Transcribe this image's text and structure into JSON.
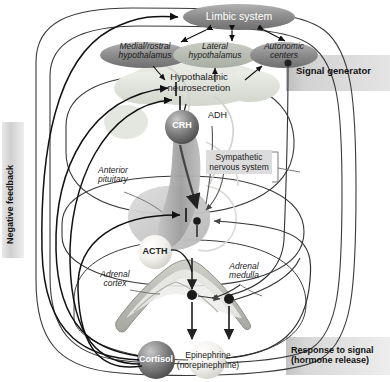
{
  "figure": {
    "type": "biological-flow-diagram"
  },
  "bands": {
    "signal_generator": "Signal generator",
    "response_line1": "Response to signal",
    "response_line2": "(hormone release)",
    "negative_feedback": "Negative feedback"
  },
  "nodes": {
    "limbic": "Limbic system",
    "medial_rostral_line1": "Medial/rostral",
    "medial_rostral_line2": "hypothalamus",
    "lateral_line1": "Lateral",
    "lateral_line2": "hypothalamus",
    "autonomic_line1": "Autonomic",
    "autonomic_line2": "centers",
    "neurosecretion_line1": "Hypothalamic",
    "neurosecretion_line2": "neurosecretion",
    "crh": "CRH",
    "adh": "ADH",
    "acth": "ACTH",
    "cortisol": "Cortisol",
    "epinephrine_line1": "Epinephrine",
    "epinephrine_line2": "(norepinephrine)"
  },
  "annotations": {
    "anterior_pituitary_line1": "Anterior",
    "anterior_pituitary_line2": "pituitary",
    "sympathetic_line1": "Sympathetic",
    "sympathetic_line2": "nervous system",
    "adrenal_cortex_line1": "Adrenal",
    "adrenal_cortex_line2": "cortex",
    "adrenal_medulla_line1": "Adrenal",
    "adrenal_medulla_line2": "medulla"
  },
  "colors": {
    "band_gray": "#cfcfcf",
    "ellipse_dark": "#8d8d8d",
    "ellipse_light": "#d8dcd6",
    "sphere_dark": "#6f6f6f",
    "sphere_light": "#eceae6",
    "arrow": "#1a1a1a",
    "outline": "#333333",
    "organ_fill": "#c9c9c4",
    "text": "#1a1a1a"
  }
}
